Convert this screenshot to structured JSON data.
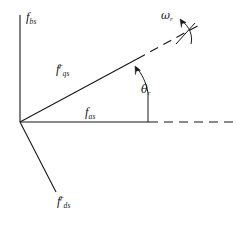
{
  "figure": {
    "type": "phasor-axis-diagram",
    "background_color": "#ffffff",
    "line_color": "#17171c",
    "origin": {
      "x": 20,
      "y": 122
    },
    "labels": {
      "b_axis": {
        "base": "f",
        "sub": "bs",
        "sup": ""
      },
      "q_axis": {
        "base": "f",
        "sub": "qs",
        "sup": "r"
      },
      "a_axis": {
        "base": "f",
        "sub": "as",
        "sup": ""
      },
      "d_axis": {
        "base": "f",
        "sub": "ds",
        "sup": "r"
      },
      "angle": {
        "base": "θ",
        "sub": "r",
        "sup": ""
      },
      "speed": {
        "base": "ω",
        "sub": "r",
        "sup": ""
      }
    },
    "axes": [
      {
        "name": "b-axis",
        "style": "solid",
        "from": [
          20,
          122
        ],
        "to": [
          20,
          15
        ]
      },
      {
        "name": "a-axis",
        "style": "solid",
        "from": [
          20,
          122
        ],
        "to": [
          148,
          122
        ]
      },
      {
        "name": "a-axis-extension",
        "style": "dashed",
        "from": [
          148,
          122
        ],
        "to": [
          232,
          122
        ]
      },
      {
        "name": "q-axis",
        "style": "solid",
        "from": [
          20,
          122
        ],
        "to": [
          140,
          57
        ]
      },
      {
        "name": "q-axis-extension",
        "style": "dashed",
        "from": [
          140,
          57
        ],
        "to": [
          200,
          24
        ]
      },
      {
        "name": "d-axis",
        "style": "solid",
        "from": [
          20,
          122
        ],
        "to": [
          55,
          190
        ]
      },
      {
        "name": "theta-reference",
        "style": "solid",
        "from": [
          148,
          122
        ],
        "to": [
          148,
          92
        ]
      }
    ],
    "arrows": [
      {
        "name": "theta-arc-arrow",
        "label": "θr"
      },
      {
        "name": "omega-arc-arrow",
        "label": "ωr"
      }
    ]
  }
}
